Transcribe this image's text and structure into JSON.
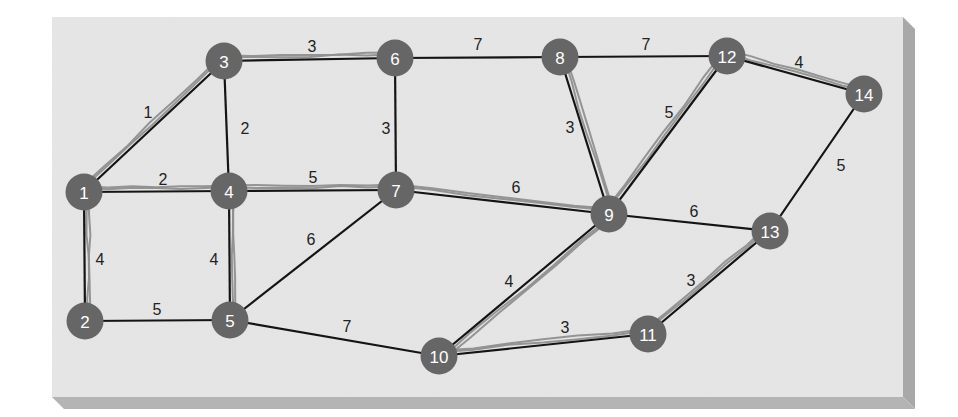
{
  "diagram": {
    "type": "weighted-undirected-graph",
    "colors": {
      "background": "#ffffff",
      "panel": "#e6e6e6",
      "panel_shadow_right": "#a8a8a8",
      "panel_shadow_bottom": "#b4b4b4",
      "node_fill": "#666666",
      "node_text": "#ffffff",
      "edge": "#141414",
      "tree_highlight": "#8f8f8f",
      "edge_label": "#222222"
    },
    "nodes": [
      {
        "id": "1",
        "label": "1",
        "x": 84,
        "y": 192
      },
      {
        "id": "2",
        "label": "2",
        "x": 85,
        "y": 321
      },
      {
        "id": "3",
        "label": "3",
        "x": 224,
        "y": 61
      },
      {
        "id": "4",
        "label": "4",
        "x": 229,
        "y": 191
      },
      {
        "id": "5",
        "label": "5",
        "x": 230,
        "y": 320
      },
      {
        "id": "6",
        "label": "6",
        "x": 395,
        "y": 58
      },
      {
        "id": "7",
        "label": "7",
        "x": 396,
        "y": 190
      },
      {
        "id": "8",
        "label": "8",
        "x": 560,
        "y": 57
      },
      {
        "id": "9",
        "label": "9",
        "x": 609,
        "y": 214
      },
      {
        "id": "10",
        "label": "10",
        "x": 439,
        "y": 356
      },
      {
        "id": "11",
        "label": "11",
        "x": 648,
        "y": 334
      },
      {
        "id": "12",
        "label": "12",
        "x": 727,
        "y": 56
      },
      {
        "id": "13",
        "label": "13",
        "x": 770,
        "y": 231
      },
      {
        "id": "14",
        "label": "14",
        "x": 864,
        "y": 94
      }
    ],
    "edges": [
      {
        "from": "1",
        "to": "3",
        "weight": "1",
        "tree": true,
        "lx": 148,
        "ly": 112
      },
      {
        "from": "1",
        "to": "4",
        "weight": "2",
        "tree": true,
        "lx": 163,
        "ly": 179
      },
      {
        "from": "1",
        "to": "2",
        "weight": "4",
        "tree": true,
        "lx": 100,
        "ly": 259
      },
      {
        "from": "3",
        "to": "6",
        "weight": "3",
        "tree": true,
        "lx": 312,
        "ly": 46
      },
      {
        "from": "3",
        "to": "4",
        "weight": "2",
        "tree": false,
        "lx": 245,
        "ly": 128
      },
      {
        "from": "4",
        "to": "7",
        "weight": "5",
        "tree": true,
        "lx": 313,
        "ly": 177
      },
      {
        "from": "4",
        "to": "5",
        "weight": "4",
        "tree": true,
        "lx": 214,
        "ly": 259
      },
      {
        "from": "2",
        "to": "5",
        "weight": "5",
        "tree": false,
        "lx": 157,
        "ly": 309
      },
      {
        "from": "6",
        "to": "7",
        "weight": "3",
        "tree": false,
        "lx": 386,
        "ly": 128
      },
      {
        "from": "6",
        "to": "8",
        "weight": "7",
        "tree": false,
        "lx": 478,
        "ly": 44
      },
      {
        "from": "5",
        "to": "7",
        "weight": "6",
        "tree": false,
        "lx": 311,
        "ly": 239
      },
      {
        "from": "5",
        "to": "10",
        "weight": "7",
        "tree": false,
        "lx": 347,
        "ly": 326
      },
      {
        "from": "7",
        "to": "9",
        "weight": "6",
        "tree": true,
        "lx": 516,
        "ly": 187
      },
      {
        "from": "8",
        "to": "12",
        "weight": "7",
        "tree": false,
        "lx": 646,
        "ly": 44
      },
      {
        "from": "8",
        "to": "9",
        "weight": "3",
        "tree": true,
        "lx": 570,
        "ly": 127
      },
      {
        "from": "9",
        "to": "12",
        "weight": "5",
        "tree": true,
        "lx": 669,
        "ly": 112
      },
      {
        "from": "12",
        "to": "14",
        "weight": "4",
        "tree": true,
        "lx": 799,
        "ly": 62
      },
      {
        "from": "14",
        "to": "13",
        "weight": "5",
        "tree": false,
        "lx": 841,
        "ly": 165
      },
      {
        "from": "9",
        "to": "13",
        "weight": "6",
        "tree": false,
        "lx": 694,
        "ly": 211
      },
      {
        "from": "9",
        "to": "10",
        "weight": "4",
        "tree": true,
        "lx": 509,
        "ly": 281
      },
      {
        "from": "10",
        "to": "11",
        "weight": "3",
        "tree": true,
        "lx": 565,
        "ly": 327
      },
      {
        "from": "11",
        "to": "13",
        "weight": "3",
        "tree": true,
        "lx": 691,
        "ly": 280
      }
    ],
    "panel": {
      "x": 52,
      "y": 17,
      "width": 851,
      "height": 380,
      "shadow_depth": 12
    }
  }
}
